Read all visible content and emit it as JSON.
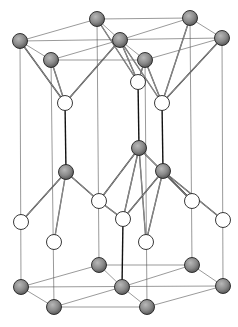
{
  "diagram": {
    "title": "",
    "colors": {
      "background": "#ffffff",
      "cell_edge": "#555555",
      "bond": "#222222",
      "atom_gray_fill": "#8a8a8a",
      "atom_white_fill": "#ffffff"
    },
    "atom_radius": 7.5,
    "atoms": {
      "gray": [
        {
          "id": "g1",
          "x": 20,
          "y": 41
        },
        {
          "id": "g2",
          "x": 51,
          "y": 60
        },
        {
          "id": "g3",
          "x": 97,
          "y": 19
        },
        {
          "id": "g4",
          "x": 120,
          "y": 40
        },
        {
          "id": "g5",
          "x": 145,
          "y": 60
        },
        {
          "id": "g6",
          "x": 190,
          "y": 18
        },
        {
          "id": "g7",
          "x": 222,
          "y": 38
        },
        {
          "id": "g8",
          "x": 66,
          "y": 172
        },
        {
          "id": "g9",
          "x": 139,
          "y": 148
        },
        {
          "id": "g10",
          "x": 163,
          "y": 171
        },
        {
          "id": "g11",
          "x": 99,
          "y": 265
        },
        {
          "id": "g12",
          "x": 192,
          "y": 265
        },
        {
          "id": "g13",
          "x": 21,
          "y": 287
        },
        {
          "id": "g14",
          "x": 122,
          "y": 287
        },
        {
          "id": "g15",
          "x": 223,
          "y": 286
        },
        {
          "id": "g16",
          "x": 54,
          "y": 307
        },
        {
          "id": "g17",
          "x": 147,
          "y": 307
        }
      ],
      "white": [
        {
          "id": "w1",
          "x": 65,
          "y": 103
        },
        {
          "id": "w2",
          "x": 138,
          "y": 82
        },
        {
          "id": "w3",
          "x": 162,
          "y": 103
        },
        {
          "id": "w4",
          "x": 99,
          "y": 201
        },
        {
          "id": "w5",
          "x": 192,
          "y": 201
        },
        {
          "id": "w6",
          "x": 21,
          "y": 222
        },
        {
          "id": "w7",
          "x": 123,
          "y": 219
        },
        {
          "id": "w8",
          "x": 223,
          "y": 220
        },
        {
          "id": "w9",
          "x": 54,
          "y": 242
        },
        {
          "id": "w10",
          "x": 146,
          "y": 242
        }
      ]
    },
    "cell_edges": [
      [
        20,
        41,
        97,
        19
      ],
      [
        97,
        19,
        190,
        18
      ],
      [
        190,
        18,
        222,
        38
      ],
      [
        222,
        38,
        145,
        60
      ],
      [
        145,
        60,
        51,
        60
      ],
      [
        51,
        60,
        20,
        41
      ],
      [
        20,
        41,
        222,
        38
      ],
      [
        97,
        19,
        120,
        40
      ],
      [
        120,
        40,
        51,
        60
      ],
      [
        190,
        18,
        120,
        40
      ],
      [
        120,
        40,
        145,
        60
      ],
      [
        21,
        287,
        99,
        265
      ],
      [
        99,
        265,
        192,
        265
      ],
      [
        192,
        265,
        223,
        286
      ],
      [
        223,
        286,
        147,
        307
      ],
      [
        147,
        307,
        54,
        307
      ],
      [
        54,
        307,
        21,
        287
      ],
      [
        21,
        287,
        223,
        286
      ],
      [
        99,
        265,
        122,
        287
      ],
      [
        122,
        287,
        54,
        307
      ],
      [
        192,
        265,
        122,
        287
      ],
      [
        122,
        287,
        147,
        307
      ],
      [
        20,
        41,
        21,
        287
      ],
      [
        51,
        60,
        54,
        307
      ],
      [
        97,
        19,
        99,
        265
      ],
      [
        145,
        60,
        147,
        307
      ],
      [
        190,
        18,
        192,
        265
      ],
      [
        222,
        38,
        223,
        286
      ]
    ],
    "bonds": [
      [
        20,
        41,
        65,
        103
      ],
      [
        51,
        60,
        65,
        103
      ],
      [
        120,
        40,
        65,
        103
      ],
      [
        97,
        19,
        138,
        82
      ],
      [
        120,
        40,
        138,
        82
      ],
      [
        145,
        60,
        138,
        82
      ],
      [
        120,
        40,
        162,
        103
      ],
      [
        145,
        60,
        162,
        103
      ],
      [
        222,
        38,
        162,
        103
      ],
      [
        190,
        18,
        162,
        103
      ],
      [
        66,
        172,
        21,
        222
      ],
      [
        66,
        172,
        99,
        201
      ],
      [
        66,
        172,
        54,
        242
      ],
      [
        139,
        148,
        99,
        201
      ],
      [
        139,
        148,
        123,
        219
      ],
      [
        139,
        148,
        192,
        201
      ],
      [
        139,
        148,
        146,
        242
      ],
      [
        163,
        171,
        123,
        219
      ],
      [
        163,
        171,
        223,
        220
      ],
      [
        163,
        171,
        146,
        242
      ],
      [
        163,
        171,
        192,
        201
      ],
      [
        99,
        201,
        123,
        219
      ]
    ],
    "vertical_bonds": [
      [
        65,
        103,
        66,
        172
      ],
      [
        138,
        82,
        139,
        148
      ],
      [
        162,
        103,
        163,
        171
      ],
      [
        123,
        219,
        122,
        287
      ]
    ]
  }
}
